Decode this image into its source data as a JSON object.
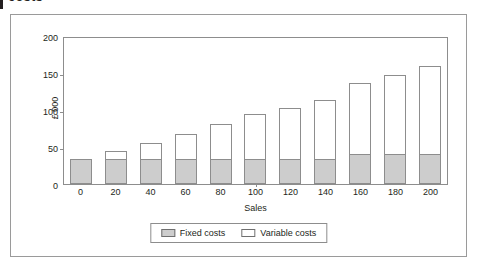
{
  "page": {
    "cut_heading": "costs"
  },
  "legend": {
    "position": "bottom-center",
    "items": [
      {
        "label": "Fixed costs",
        "swatch": "gray-filled-swatch-icon",
        "color": "#cdcdcd"
      },
      {
        "label": "Variable costs",
        "swatch": "white-filled-swatch-icon",
        "color": "#ffffff"
      }
    ]
  },
  "chart_data": {
    "type": "bar",
    "stacked": true,
    "title": "",
    "subtitle": "",
    "xlabel": "Sales",
    "ylabel": "£ 000",
    "categories": [
      "0",
      "20",
      "40",
      "60",
      "80",
      "100",
      "120",
      "140",
      "160",
      "180",
      "200"
    ],
    "series": [
      {
        "name": "Fixed costs",
        "color": "#cdcdcd",
        "values": [
          34,
          34,
          34,
          34,
          34,
          34,
          34,
          34,
          41,
          41,
          41
        ]
      },
      {
        "name": "Variable costs",
        "color": "#ffffff",
        "values": [
          0,
          11,
          21,
          34,
          47,
          61,
          69,
          80,
          96,
          107,
          118
        ]
      }
    ],
    "totals": [
      34,
      45,
      55,
      68,
      81,
      95,
      103,
      114,
      137,
      148,
      159
    ],
    "ylim": [
      0,
      200
    ],
    "yticks": [
      0,
      50,
      100,
      150,
      200
    ],
    "ytick_labels": [
      "0",
      "50",
      "100",
      "150",
      "200"
    ],
    "xtick_labels": [
      "0",
      "20",
      "40",
      "60",
      "80",
      "100",
      "120",
      "140",
      "160",
      "180",
      "200"
    ],
    "grid": false,
    "legend_position": "bottom-center"
  }
}
